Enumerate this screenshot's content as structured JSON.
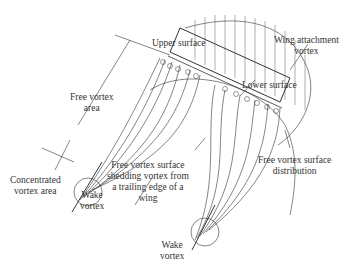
{
  "diagram": {
    "labels": {
      "upper_surface": "Upper surface",
      "wing_attachment_vortex": [
        "Wing attachment",
        "vortex"
      ],
      "lower_surface": "Lower surface",
      "free_vortex_area": [
        "Free vortex",
        "area"
      ],
      "concentrated_vortex_area": [
        "Concentrated",
        "vortex area"
      ],
      "wake_vortex_left": [
        "Wake",
        "vortex"
      ],
      "free_vortex_shedding": [
        "Free vortex surface",
        "shedding vortex from",
        "a trailing edge of a",
        "wing"
      ],
      "free_vortex_distribution": [
        "Free vortex surface",
        "distribution"
      ],
      "wake_vortex_bottom": [
        "Wake",
        "vortex"
      ]
    },
    "colors": {
      "line": "#333333",
      "text": "#333333",
      "background": "#ffffff"
    }
  }
}
